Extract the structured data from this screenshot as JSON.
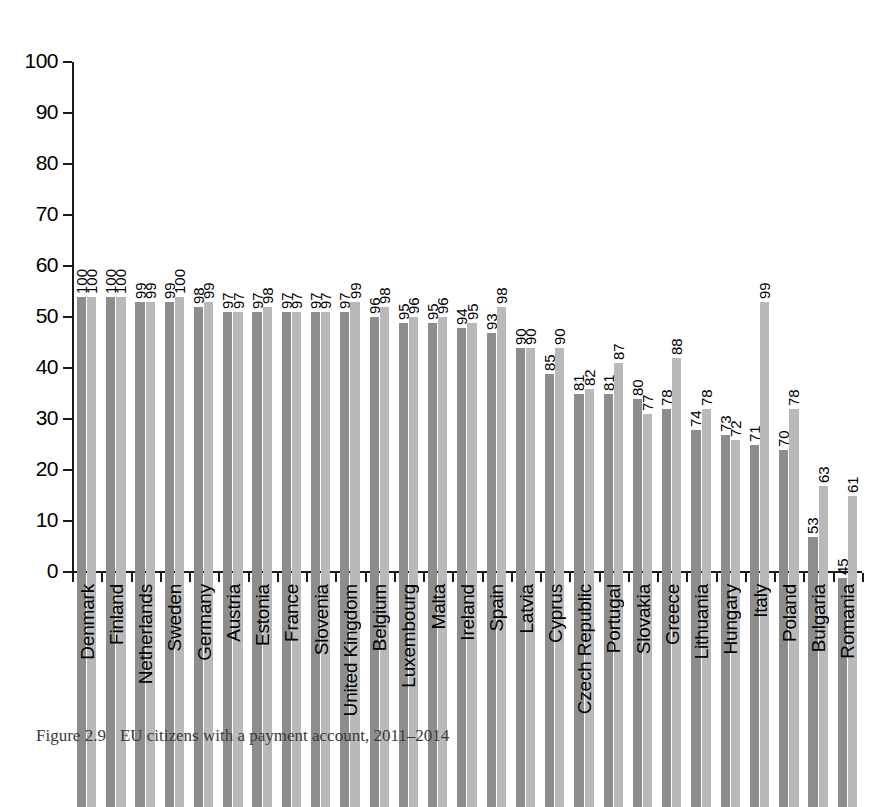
{
  "caption": {
    "figure_number": "Figure 2.9",
    "text": "EU citizens with a payment account, 2011–2014"
  },
  "chart_data": {
    "type": "bar",
    "title": "",
    "subtitle": "",
    "xlabel": "",
    "ylabel": "",
    "ylim": [
      0,
      100
    ],
    "yticks": [
      0,
      10,
      20,
      30,
      40,
      50,
      60,
      70,
      80,
      90,
      100
    ],
    "grid": false,
    "legend": "none",
    "orientation": "vertical",
    "grouping": "grouped",
    "value_labels": true,
    "value_label_rotation": -90,
    "category_label_rotation": -90,
    "colors": {
      "series_2011": "#8d8d8d",
      "series_2014": "#b9b9b9",
      "axis": "#1a1a1a",
      "text": "#000000",
      "background": "#ffffff"
    },
    "categories": [
      "Denmark",
      "Finland",
      "Netherlands",
      "Sweden",
      "Germany",
      "Austria",
      "Estonia",
      "France",
      "Slovenia",
      "United Kingdom",
      "Belgium",
      "Luxembourg",
      "Malta",
      "Ireland",
      "Spain",
      "Latvia",
      "Cyprus",
      "Czech Republic",
      "Portugal",
      "Slovakia",
      "Greece",
      "Lithuania",
      "Hungary",
      "Italy",
      "Poland",
      "Bulgaria",
      "Romania"
    ],
    "series": [
      {
        "name": "2011",
        "color": "#8d8d8d",
        "values": [
          100,
          100,
          99,
          99,
          98,
          97,
          97,
          97,
          97,
          97,
          96,
          95,
          95,
          94,
          93,
          90,
          85,
          81,
          81,
          80,
          78,
          74,
          73,
          71,
          70,
          53,
          45
        ]
      },
      {
        "name": "2014",
        "color": "#b9b9b9",
        "values": [
          100,
          100,
          99,
          100,
          99,
          97,
          98,
          97,
          97,
          99,
          98,
          96,
          96,
          95,
          98,
          90,
          90,
          82,
          87,
          77,
          88,
          78,
          72,
          99,
          78,
          63,
          61
        ]
      }
    ]
  }
}
